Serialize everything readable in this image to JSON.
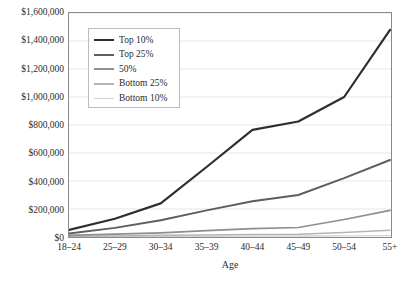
{
  "chart_data": {
    "type": "line",
    "title": "",
    "xlabel": "Age",
    "ylabel": "",
    "categories": [
      "18–24",
      "25–29",
      "30–34",
      "35–39",
      "40–44",
      "45–49",
      "50–54",
      "55+"
    ],
    "ylim": [
      0,
      1600000
    ],
    "ytick_values": [
      0,
      200000,
      400000,
      600000,
      800000,
      1000000,
      1200000,
      1400000,
      1600000
    ],
    "ytick_labels": [
      "$0",
      "$200,000",
      "$400,000",
      "$600,000",
      "$800,000",
      "$1,000,000",
      "$1,200,000",
      "$1,400,000",
      "$1,600,000"
    ],
    "grid": "horizontal",
    "legend_position": "upper-left-inside",
    "series": [
      {
        "name": "Top 10%",
        "color": "#2e2e2e",
        "width": 2.2,
        "values": [
          50000,
          130000,
          240000,
          500000,
          765000,
          825000,
          1000000,
          1480000
        ]
      },
      {
        "name": "Top 25%",
        "color": "#5e5e5e",
        "width": 1.9,
        "values": [
          25000,
          65000,
          120000,
          190000,
          255000,
          300000,
          420000,
          550000
        ]
      },
      {
        "name": "50%",
        "color": "#8e8e8e",
        "width": 1.7,
        "values": [
          12000,
          20000,
          30000,
          45000,
          60000,
          68000,
          125000,
          190000
        ]
      },
      {
        "name": "Bottom 25%",
        "color": "#b4b4b4",
        "width": 1.5,
        "values": [
          5000,
          8000,
          12000,
          15000,
          18000,
          20000,
          32000,
          48000
        ]
      },
      {
        "name": "Bottom 10%",
        "color": "#d2d2d2",
        "width": 1.3,
        "values": [
          2000,
          3000,
          4000,
          5000,
          6000,
          7000,
          8000,
          10000
        ]
      }
    ]
  },
  "colors": {
    "frame": "#8a8a8a",
    "gridline": "#e6e6e6",
    "legend_border": "#bdbdbd",
    "text": "#2b2b2b",
    "background": "#ffffff"
  }
}
